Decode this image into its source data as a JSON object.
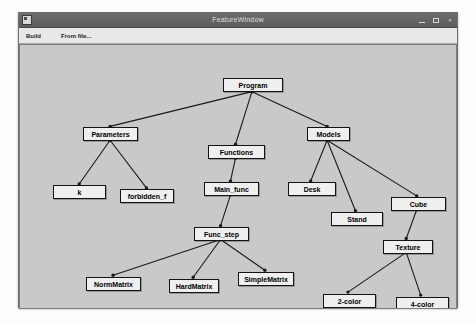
{
  "window": {
    "title": "FeatureWindow",
    "icon": "app-icon",
    "controls": {
      "minimize": "minimize-button",
      "maximize": "maximize-button",
      "close_label": "×"
    }
  },
  "menubar": {
    "items": [
      {
        "label": "Build"
      },
      {
        "label": "From file..."
      }
    ]
  },
  "colors": {
    "node_fill": "#efefef",
    "node_border": "#131313",
    "canvas_bg": "#c9c9c9",
    "edge": "#1a1a1a",
    "titlebar": "#5d5d5d"
  },
  "graph": {
    "type": "tree",
    "nodes": [
      {
        "id": "program",
        "label": "Program",
        "x": 203,
        "y": 33,
        "w": 60
      },
      {
        "id": "parameters",
        "label": "Parameters",
        "x": 63,
        "y": 82,
        "w": 55
      },
      {
        "id": "functions",
        "label": "Functions",
        "x": 188,
        "y": 100,
        "w": 57
      },
      {
        "id": "models",
        "label": "Models",
        "x": 287,
        "y": 82,
        "w": 43
      },
      {
        "id": "k",
        "label": "k",
        "x": 33,
        "y": 140,
        "w": 53
      },
      {
        "id": "forbidden_f",
        "label": "forbidden_f",
        "x": 100,
        "y": 144,
        "w": 54
      },
      {
        "id": "main_func",
        "label": "Main_func",
        "x": 184,
        "y": 137,
        "w": 55
      },
      {
        "id": "desk",
        "label": "Desk",
        "x": 268,
        "y": 137,
        "w": 48
      },
      {
        "id": "stand",
        "label": "Stand",
        "x": 311,
        "y": 167,
        "w": 52
      },
      {
        "id": "cube",
        "label": "Cube",
        "x": 371,
        "y": 152,
        "w": 55
      },
      {
        "id": "func_step",
        "label": "Func_step",
        "x": 174,
        "y": 182,
        "w": 55
      },
      {
        "id": "texture",
        "label": "Texture",
        "x": 363,
        "y": 195,
        "w": 50
      },
      {
        "id": "normmatrix",
        "label": "NormMatrix",
        "x": 66,
        "y": 232,
        "w": 55
      },
      {
        "id": "hardmatrix",
        "label": "HardMatrix",
        "x": 149,
        "y": 234,
        "w": 50
      },
      {
        "id": "simplematrix",
        "label": "SimpleMatrix",
        "x": 218,
        "y": 227,
        "w": 56
      },
      {
        "id": "2color",
        "label": "2-color",
        "x": 303,
        "y": 249,
        "w": 53
      },
      {
        "id": "4color",
        "label": "4-color",
        "x": 376,
        "y": 252,
        "w": 53
      }
    ],
    "edges": [
      {
        "from": "program",
        "to": "parameters"
      },
      {
        "from": "program",
        "to": "functions"
      },
      {
        "from": "program",
        "to": "models"
      },
      {
        "from": "parameters",
        "to": "k"
      },
      {
        "from": "parameters",
        "to": "forbidden_f"
      },
      {
        "from": "functions",
        "to": "main_func"
      },
      {
        "from": "main_func",
        "to": "func_step"
      },
      {
        "from": "func_step",
        "to": "normmatrix"
      },
      {
        "from": "func_step",
        "to": "hardmatrix"
      },
      {
        "from": "func_step",
        "to": "simplematrix"
      },
      {
        "from": "models",
        "to": "desk"
      },
      {
        "from": "models",
        "to": "stand"
      },
      {
        "from": "models",
        "to": "cube"
      },
      {
        "from": "cube",
        "to": "texture"
      },
      {
        "from": "texture",
        "to": "2color"
      },
      {
        "from": "texture",
        "to": "4color"
      }
    ]
  }
}
